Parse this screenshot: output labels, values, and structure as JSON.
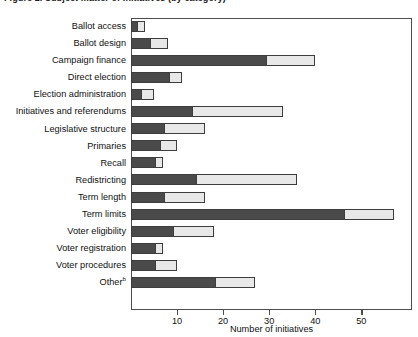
{
  "figure": {
    "title": "Figure 2. Subject matter of initiatives (by category)"
  },
  "axis": {
    "x_title": "Number of initiatives",
    "x_ticks": [
      {
        "value": 10,
        "label": "10"
      },
      {
        "value": 20,
        "label": "20"
      },
      {
        "value": 30,
        "label": "30"
      },
      {
        "value": 40,
        "label": "40"
      },
      {
        "value": 50,
        "label": "50"
      }
    ],
    "x_min": 0,
    "x_max": 61
  },
  "style": {
    "dark_color": "#4a4a4a",
    "light_color": "#e8e8e8",
    "outline_color": "#3d3d3d",
    "frame_color": "#4d4d4d"
  },
  "chart_data": {
    "type": "bar",
    "orientation": "horizontal",
    "stacked": true,
    "title": "Figure 2. Subject matter of initiatives (by category)",
    "xlabel": "Number of initiatives",
    "ylabel": "",
    "xlim": [
      0,
      61
    ],
    "grid": false,
    "legend": "none",
    "categories": [
      "Ballot access",
      "Ballot design",
      "Campaign finance",
      "Direct election",
      "Election administration",
      "Initiatives and referendums",
      "Legislative structure",
      "Primaries",
      "Recall",
      "Redistricting",
      "Term length",
      "Term limits",
      "Voter eligibility",
      "Voter registration",
      "Voter procedures",
      "Other"
    ],
    "category_footnotes": {
      "Other": "b"
    },
    "series": [
      {
        "name": "dark-segment",
        "color": "#4a4a4a",
        "values": [
          1,
          4,
          29,
          8,
          2,
          13,
          7,
          6,
          5,
          14,
          7,
          46,
          9,
          5,
          5,
          18
        ]
      },
      {
        "name": "light-segment",
        "color": "#e8e8e8",
        "values": [
          2,
          4,
          11,
          3,
          3,
          20,
          9,
          4,
          2,
          22,
          9,
          11,
          9,
          2,
          5,
          9
        ]
      }
    ],
    "totals": [
      3,
      8,
      40,
      11,
      5,
      33,
      16,
      10,
      7,
      36,
      16,
      57,
      18,
      7,
      10,
      27
    ]
  }
}
